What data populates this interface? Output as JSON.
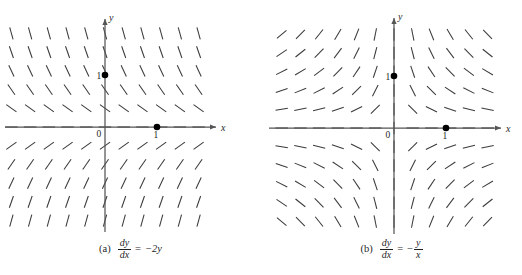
{
  "figure": {
    "background_color": "#ffffff",
    "axis_color": "#555555",
    "segment_color": "#3a3a3a",
    "dot_color": "#000000",
    "text_color": "#1f1f1f"
  },
  "panels": [
    {
      "id": "a",
      "tag": "(a)",
      "equation": {
        "lhs_numerator": "dy",
        "lhs_denominator": "dx",
        "equals": "=",
        "rhs_text": "−2y",
        "rhs_sign": "−",
        "rhs_body": "2y",
        "rhs_is_fraction": false,
        "rhs_numerator": "",
        "rhs_denominator": ""
      },
      "axes": {
        "x_label": "x",
        "y_label": "y",
        "origin_label": "0",
        "x_tick_label": "1",
        "y_tick_label": "1"
      },
      "points": [
        {
          "label": "1",
          "x": 1,
          "y": 0,
          "label_side": "left"
        },
        {
          "label": "1",
          "x": 0,
          "y": 1,
          "label_side": "left"
        }
      ]
    },
    {
      "id": "b",
      "tag": "(b)",
      "equation": {
        "lhs_numerator": "dy",
        "lhs_denominator": "dx",
        "equals": "=",
        "rhs_text": "−y/x",
        "rhs_sign": "−",
        "rhs_body": "",
        "rhs_is_fraction": true,
        "rhs_numerator": "y",
        "rhs_denominator": "x"
      },
      "axes": {
        "x_label": "x",
        "y_label": "y",
        "origin_label": "0",
        "x_tick_label": "1",
        "y_tick_label": "1"
      },
      "points": [
        {
          "label": "1",
          "x": 1,
          "y": 0,
          "label_side": "left"
        },
        {
          "label": "1",
          "x": 0,
          "y": 1,
          "label_side": "left"
        }
      ]
    }
  ],
  "chart_data": [
    {
      "type": "scatter",
      "subtype": "slope-field",
      "panel": "a",
      "title": "(a) dy/dx = -2y",
      "equation": "dy/dx = -2y",
      "slope_formula": "-2*y",
      "xlabel": "x",
      "ylabel": "y",
      "xlim": [
        -2.0,
        2.1
      ],
      "ylim": [
        -2.05,
        2.05
      ],
      "grid": false,
      "legend": null,
      "sample_x": [
        -1.8,
        -1.44,
        -1.08,
        -0.72,
        -0.36,
        0.0,
        0.36,
        0.72,
        1.08,
        1.44,
        1.8
      ],
      "sample_y": [
        1.8,
        1.44,
        1.08,
        0.72,
        0.36,
        0.0,
        -0.36,
        -0.72,
        -1.08,
        -1.44,
        -1.8
      ],
      "marked_points": [
        [
          1,
          0
        ],
        [
          0,
          1
        ]
      ],
      "annotations": [
        "0",
        "1",
        "1",
        "x",
        "y"
      ]
    },
    {
      "type": "scatter",
      "subtype": "slope-field",
      "panel": "b",
      "title": "(b) dy/dx = -y/x",
      "equation": "dy/dx = -y/x",
      "slope_formula": "-y/x",
      "xlabel": "x",
      "ylabel": "y",
      "xlim": [
        -2.45,
        2.1
      ],
      "ylim": [
        -2.05,
        2.05
      ],
      "grid": false,
      "legend": null,
      "sample_x": [
        -2.16,
        -1.8,
        -1.44,
        -1.08,
        -0.72,
        -0.36,
        0.0,
        0.36,
        0.72,
        1.08,
        1.44,
        1.8
      ],
      "sample_y": [
        1.8,
        1.44,
        1.08,
        0.72,
        0.36,
        0.0,
        -0.36,
        -0.72,
        -1.08,
        -1.44,
        -1.8
      ],
      "marked_points": [
        [
          1,
          0
        ],
        [
          0,
          1
        ]
      ],
      "annotations": [
        "0",
        "1",
        "1",
        "x",
        "y"
      ]
    }
  ]
}
